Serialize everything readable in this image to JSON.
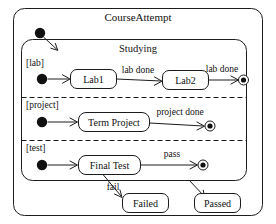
{
  "diagram": {
    "type": "uml-state-machine",
    "outer_state": {
      "name": "CourseAttempt"
    },
    "composite_state": {
      "name": "Studying"
    },
    "regions": [
      {
        "guard": "[lab]",
        "states": [
          "Lab1",
          "Lab2"
        ],
        "transitions": [
          "lab done",
          "lab done"
        ]
      },
      {
        "guard": "[project]",
        "states": [
          "Term Project"
        ],
        "transitions": [
          "project done"
        ]
      },
      {
        "guard": "[test]",
        "states": [
          "Final Test"
        ],
        "transitions": [
          "pass"
        ]
      }
    ],
    "outcome_states": [
      {
        "name": "Failed"
      },
      {
        "name": "Passed"
      }
    ],
    "labels": {
      "title": "CourseAttempt",
      "studying": "Studying",
      "guard_lab": "[lab]",
      "guard_project": "[project]",
      "guard_test": "[test]",
      "lab1": "Lab1",
      "lab2": "Lab2",
      "term_project": "Term Project",
      "final_test": "Final Test",
      "failed": "Failed",
      "passed": "Passed",
      "lab_done_1": "lab done",
      "lab_done_2": "lab done",
      "project_done": "project done",
      "pass": "pass",
      "fail": "fail"
    },
    "colors": {
      "stroke": "#1c1c1c",
      "fill": "#ffffff",
      "text": "#111111",
      "dot": "#111111"
    }
  }
}
